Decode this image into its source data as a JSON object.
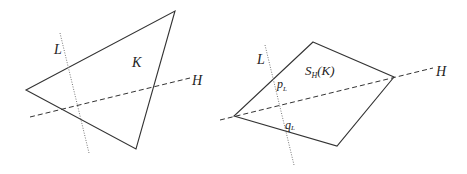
{
  "left_figure": {
    "shape_label": "K",
    "line_label": "L",
    "hyperplane_label": "H",
    "triangle": [
      [
        26,
        90
      ],
      [
        175,
        11
      ],
      [
        136,
        149
      ]
    ],
    "line_L": [
      [
        60,
        33
      ],
      [
        89,
        153
      ]
    ],
    "line_H": [
      [
        30,
        117
      ],
      [
        190,
        78
      ]
    ]
  },
  "right_figure": {
    "shape_label": "S",
    "shape_label_sub": "H",
    "shape_label_suffix": "(K)",
    "line_label": "L",
    "hyperplane_label": "H",
    "point_p": "p",
    "point_p_sub": "L",
    "point_q": "q",
    "point_q_sub": "L",
    "quad": [
      [
        313,
        42
      ],
      [
        394,
        77
      ],
      [
        337,
        146
      ],
      [
        234,
        116
      ]
    ],
    "line_L": [
      [
        265,
        45
      ],
      [
        294,
        165
      ]
    ],
    "line_H": [
      [
        220,
        120
      ],
      [
        433,
        68
      ]
    ]
  },
  "colors": {
    "stroke": "#333333",
    "dotted": "#777777"
  }
}
